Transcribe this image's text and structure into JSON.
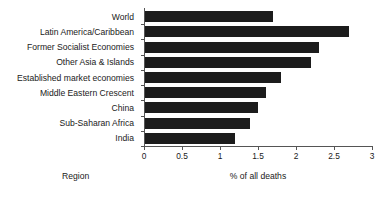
{
  "chart_data": {
    "type": "bar",
    "orientation": "horizontal",
    "title": "",
    "subtitle": "",
    "xlabel": "% of all deaths",
    "ylabel": "Region",
    "xlim": [
      0,
      3
    ],
    "xticks": [
      "0",
      "0.5",
      "1",
      "1.5",
      "2",
      "2.5",
      "3"
    ],
    "xtick_values": [
      0,
      0.5,
      1,
      1.5,
      2,
      2.5,
      3
    ],
    "grid": false,
    "legend": null,
    "bar_color": "#1c1c1c",
    "axis_color": "#555555",
    "categories": [
      "World",
      "Latin America/Caribbean",
      "Former Socialist Economies",
      "Other Asia & Islands",
      "Established market economies",
      "Middle Eastern Crescent",
      "China",
      "Sub-Saharan Africa",
      "India"
    ],
    "values": [
      1.7,
      2.7,
      2.3,
      2.2,
      1.8,
      1.6,
      1.5,
      1.4,
      1.2
    ]
  }
}
